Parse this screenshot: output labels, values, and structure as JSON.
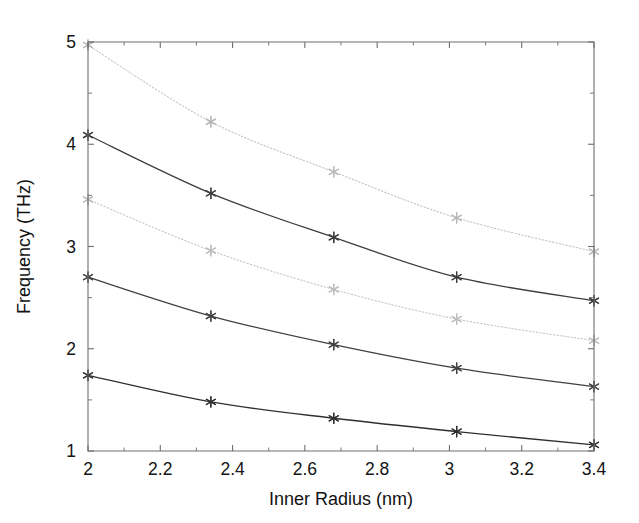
{
  "chart_data": {
    "type": "line",
    "title": "",
    "subtitle": "",
    "xlabel": "Inner Radius (nm)",
    "ylabel": "Frequency (THz)",
    "xlim": [
      2.0,
      3.4
    ],
    "ylim": [
      1,
      5
    ],
    "xticks": [
      2,
      2.2,
      2.4,
      2.6,
      2.8,
      3,
      3.2,
      3.4
    ],
    "xticklabels": [
      "2",
      "2.2",
      "2.4",
      "2.6",
      "2.8",
      "3",
      "3.2",
      "3.4"
    ],
    "xticks_minor": [
      2.1,
      2.3,
      2.5,
      2.7,
      2.9,
      3.1,
      3.3
    ],
    "yticks": [
      1,
      2,
      3,
      4,
      5
    ],
    "yticklabels": [
      "1",
      "2",
      "3",
      "4",
      "5"
    ],
    "yticks_minor": [
      1.5,
      2.5,
      3.5,
      4.5
    ],
    "grid": false,
    "legend": "none",
    "marker": "asterisk",
    "x": [
      2.0,
      2.34,
      2.68,
      3.02,
      3.4
    ],
    "series": [
      {
        "name": "mode-5",
        "values": [
          4.97,
          4.22,
          3.73,
          3.28,
          2.95
        ],
        "color": "#b9b9b9",
        "style": "dotted",
        "width": 1.0
      },
      {
        "name": "mode-4",
        "values": [
          4.09,
          3.52,
          3.09,
          2.7,
          2.47
        ],
        "color": "#3d3d3d",
        "style": "solid",
        "width": 1.25
      },
      {
        "name": "mode-3",
        "values": [
          3.46,
          2.96,
          2.58,
          2.29,
          2.08
        ],
        "color": "#bdbdbd",
        "style": "dotted",
        "width": 1.0
      },
      {
        "name": "mode-2",
        "values": [
          2.7,
          2.32,
          2.04,
          1.81,
          1.63
        ],
        "color": "#414141",
        "style": "solid",
        "width": 1.25
      },
      {
        "name": "mode-1",
        "values": [
          1.74,
          1.48,
          1.32,
          1.19,
          1.06
        ],
        "color": "#2f2f2f",
        "style": "solid",
        "width": 1.35
      }
    ]
  },
  "figure": {
    "background_color": "#ffffff",
    "axis_color": "#6f6f6f",
    "text_color": "#141414"
  }
}
